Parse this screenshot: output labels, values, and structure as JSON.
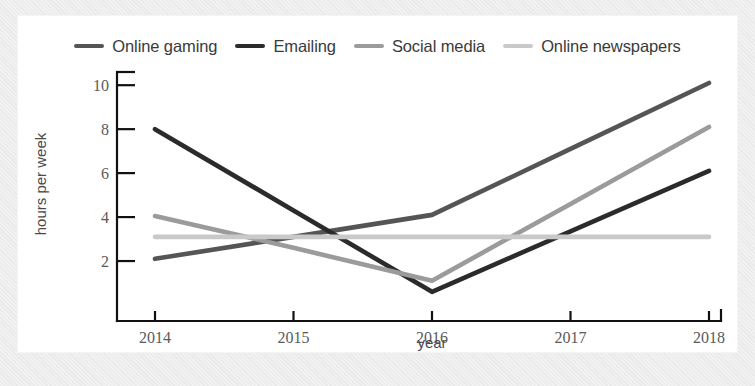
{
  "chart_data": {
    "type": "line",
    "title": "",
    "xlabel": "year",
    "ylabel": "hours per week",
    "x": [
      "2014",
      "2015",
      "2016",
      "2017",
      "2018"
    ],
    "categories": [
      "2014",
      "2015",
      "2016",
      "2017",
      "2018"
    ],
    "xlim": [
      2014,
      2018
    ],
    "ylim": [
      0,
      10.6
    ],
    "yticks": [
      "2",
      "4",
      "6",
      "8",
      "10"
    ],
    "ytick_values": [
      2,
      4,
      6,
      8,
      10
    ],
    "grid": false,
    "legend_position": "top",
    "series": [
      {
        "name": "Online gaming",
        "color": "#555555",
        "values": [
          2.1,
          3.1,
          4.1,
          7.1,
          10.1
        ]
      },
      {
        "name": "Emailing",
        "color": "#2b2b2b",
        "values": [
          8.0,
          4.3,
          0.6,
          3.35,
          6.1
        ]
      },
      {
        "name": "Social media",
        "color": "#9b9b9b",
        "values": [
          4.05,
          2.6,
          1.1,
          4.6,
          8.1
        ]
      },
      {
        "name": "Online newspapers",
        "color": "#c9c9c9",
        "values": [
          3.1,
          3.1,
          3.1,
          3.1,
          3.1
        ]
      }
    ]
  },
  "legend": {
    "items": [
      {
        "label": "Online gaming",
        "color": "#555555",
        "icon": "line-swatch-icon"
      },
      {
        "label": "Emailing",
        "color": "#2b2b2b",
        "icon": "line-swatch-icon"
      },
      {
        "label": "Social media",
        "color": "#9b9b9b",
        "icon": "line-swatch-icon"
      },
      {
        "label": "Online newspapers",
        "color": "#c9c9c9",
        "icon": "line-swatch-icon"
      }
    ]
  },
  "axes": {
    "x_label": "year",
    "y_label": "hours per week",
    "x_ticks": [
      "2014",
      "2015",
      "2016",
      "2017",
      "2018"
    ],
    "y_ticks": [
      "2",
      "4",
      "6",
      "8",
      "10"
    ]
  }
}
